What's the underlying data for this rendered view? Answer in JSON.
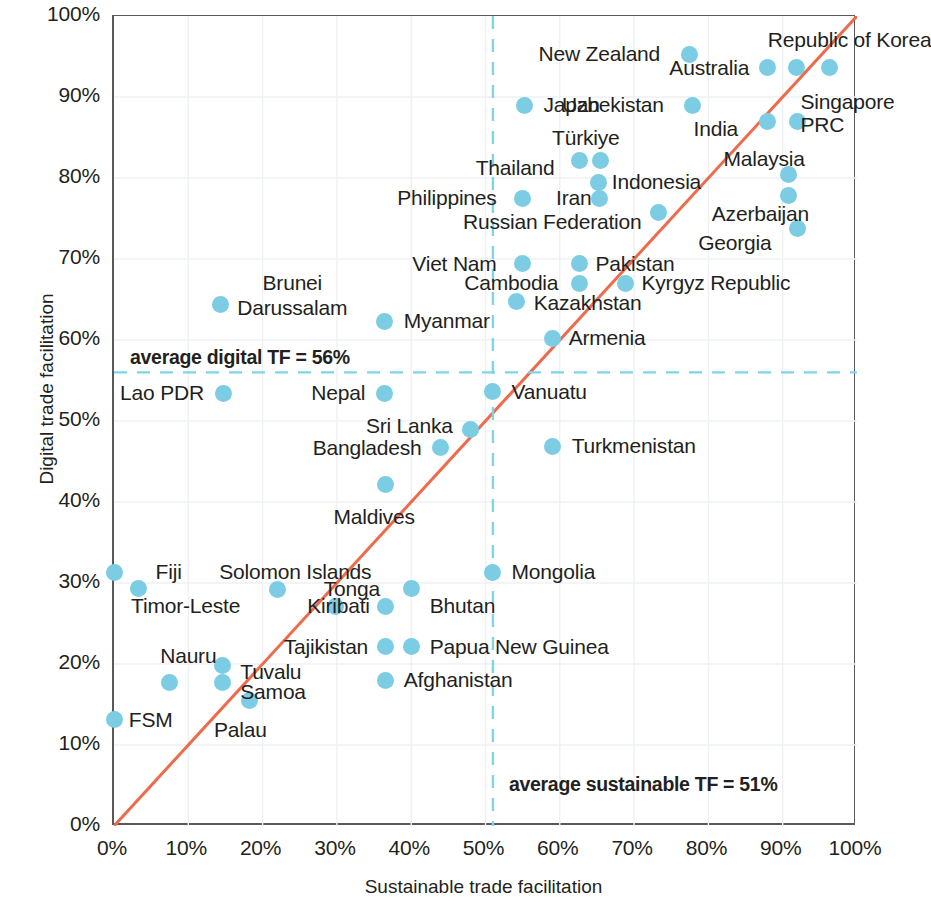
{
  "chart_data": {
    "type": "scatter",
    "title": "",
    "xlabel": "Sustainable trade facilitation",
    "ylabel": "Digital trade facilitation",
    "xlim": [
      0,
      100
    ],
    "ylim": [
      0,
      100
    ],
    "xticks": [
      "0%",
      "10%",
      "20%",
      "30%",
      "40%",
      "50%",
      "60%",
      "70%",
      "80%",
      "90%",
      "100%"
    ],
    "yticks": [
      "0%",
      "10%",
      "20%",
      "30%",
      "40%",
      "50%",
      "60%",
      "70%",
      "80%",
      "90%",
      "100%"
    ],
    "xtick_values": [
      0,
      10,
      20,
      30,
      40,
      50,
      60,
      70,
      80,
      90,
      100
    ],
    "ytick_values": [
      0,
      10,
      20,
      30,
      40,
      50,
      60,
      70,
      80,
      90,
      100
    ],
    "grid": true,
    "legend": "none",
    "marker_color": "#7ccde4",
    "reference_line_color": "#ef6a4a",
    "average_line_color": "#7fd4e8",
    "annotations": {
      "digital_avg_label": "average digital TF = 56%",
      "sustainable_avg_label": "average sustainable TF = 51%",
      "digital_avg_value": 56,
      "sustainable_avg_value": 51
    },
    "diagonal_line": {
      "from": [
        0,
        0
      ],
      "to": [
        100,
        100
      ]
    },
    "points": [
      {
        "name": "New Zealand",
        "x": 77.4,
        "y": 95.3,
        "lx": 73.5,
        "ly": 95.3,
        "anchor": "r"
      },
      {
        "name": "Republic of Korea",
        "x": 91.8,
        "y": 93.6,
        "lx": 88.0,
        "ly": 97.0,
        "anchor": "l"
      },
      {
        "name": "Australia",
        "x": 88.0,
        "y": 93.6,
        "lx": 85.5,
        "ly": 93.6,
        "anchor": "r"
      },
      {
        "name": "Singapore",
        "x": 96.3,
        "y": 93.6,
        "lx": 92.4,
        "ly": 89.4,
        "anchor": "l"
      },
      {
        "name": "Japan",
        "x": 55.3,
        "y": 89.0,
        "lx": 57.8,
        "ly": 89.0,
        "anchor": "l"
      },
      {
        "name": "Uzbekistan",
        "x": 77.8,
        "y": 89.0,
        "lx": 74.0,
        "ly": 89.0,
        "anchor": "r"
      },
      {
        "name": "India",
        "x": 88.0,
        "y": 87.0,
        "lx": 84.0,
        "ly": 86.0,
        "anchor": "r"
      },
      {
        "name": "PRC",
        "x": 92.0,
        "y": 87.0,
        "lx": 92.4,
        "ly": 86.5,
        "anchor": "l"
      },
      {
        "name": "Türkiye",
        "x": 65.5,
        "y": 82.2,
        "lx": 63.5,
        "ly": 85.0,
        "anchor": "c"
      },
      {
        "name": "Thailand",
        "x": 62.6,
        "y": 82.2,
        "lx": 59.3,
        "ly": 81.2,
        "anchor": "r"
      },
      {
        "name": "Malaysia",
        "x": 90.8,
        "y": 80.4,
        "lx": 87.5,
        "ly": 82.4,
        "anchor": "c"
      },
      {
        "name": "Indonesia",
        "x": 65.2,
        "y": 79.5,
        "lx": 67.0,
        "ly": 79.5,
        "anchor": "l"
      },
      {
        "name": "Philippines",
        "x": 55.0,
        "y": 77.5,
        "lx": 51.5,
        "ly": 77.5,
        "anchor": "r"
      },
      {
        "name": "Iran",
        "x": 65.4,
        "y": 77.5,
        "lx": 59.5,
        "ly": 77.5,
        "anchor": "l"
      },
      {
        "name": "Azerbaijan",
        "x": 90.8,
        "y": 77.8,
        "lx": 87.0,
        "ly": 75.6,
        "anchor": "c"
      },
      {
        "name": "Russian Federation",
        "x": 73.3,
        "y": 75.7,
        "lx": 71.0,
        "ly": 74.6,
        "anchor": "r"
      },
      {
        "name": "Georgia",
        "x": 92.0,
        "y": 73.8,
        "lx": 88.5,
        "ly": 72.0,
        "anchor": "r"
      },
      {
        "name": "Viet Nam",
        "x": 55.0,
        "y": 69.4,
        "lx": 51.5,
        "ly": 69.4,
        "anchor": "r"
      },
      {
        "name": "Pakistan",
        "x": 62.7,
        "y": 69.4,
        "lx": 64.8,
        "ly": 69.4,
        "anchor": "l"
      },
      {
        "name": "Cambodia",
        "x": 62.7,
        "y": 67.0,
        "lx": 59.8,
        "ly": 67.0,
        "anchor": "r"
      },
      {
        "name": "Kyrgyz Republic",
        "x": 68.8,
        "y": 67.0,
        "lx": 71.0,
        "ly": 67.0,
        "anchor": "l"
      },
      {
        "name": "Kazakhstan",
        "x": 54.2,
        "y": 64.8,
        "lx": 56.5,
        "ly": 64.6,
        "anchor": "l"
      },
      {
        "name": "Brunei Darussalam",
        "x": 14.4,
        "y": 64.4,
        "lx": 24.0,
        "ly": 65.5,
        "anchor": "c",
        "multiline": true
      },
      {
        "name": "Myanmar",
        "x": 36.4,
        "y": 62.3,
        "lx": 39.0,
        "ly": 62.3,
        "anchor": "l"
      },
      {
        "name": "Armenia",
        "x": 59.0,
        "y": 60.2,
        "lx": 61.2,
        "ly": 60.2,
        "anchor": "l"
      },
      {
        "name": "Lao PDR",
        "x": 14.7,
        "y": 53.4,
        "lx": 12.1,
        "ly": 53.4,
        "anchor": "r"
      },
      {
        "name": "Nepal",
        "x": 36.4,
        "y": 53.4,
        "lx": 33.8,
        "ly": 53.4,
        "anchor": "r"
      },
      {
        "name": "Vanuatu",
        "x": 51.0,
        "y": 53.6,
        "lx": 53.5,
        "ly": 53.6,
        "anchor": "l"
      },
      {
        "name": "Sri Lanka",
        "x": 48.0,
        "y": 49.0,
        "lx": 45.6,
        "ly": 49.4,
        "anchor": "r"
      },
      {
        "name": "Turkmenistan",
        "x": 59.0,
        "y": 46.9,
        "lx": 61.6,
        "ly": 46.9,
        "anchor": "l"
      },
      {
        "name": "Bangladesh",
        "x": 44.0,
        "y": 46.7,
        "lx": 41.4,
        "ly": 46.7,
        "anchor": "r"
      },
      {
        "name": "Maldives",
        "x": 36.5,
        "y": 42.2,
        "lx": 35.0,
        "ly": 38.2,
        "anchor": "c"
      },
      {
        "name": "Fiji",
        "x": 3.3,
        "y": 29.3,
        "lx": 5.6,
        "ly": 31.3,
        "anchor": "l"
      },
      {
        "name": "Timor-Leste",
        "x": 0.0,
        "y": 31.3,
        "lx": 2.3,
        "ly": 27.2,
        "anchor": "l"
      },
      {
        "name": "Solomon Islands",
        "x": 22.0,
        "y": 29.2,
        "lx": 24.4,
        "ly": 31.3,
        "anchor": "c"
      },
      {
        "name": "Tonga",
        "x": 29.8,
        "y": 27.1,
        "lx": 32.0,
        "ly": 29.2,
        "anchor": "c"
      },
      {
        "name": "Bhutan",
        "x": 40.0,
        "y": 29.3,
        "lx": 42.5,
        "ly": 27.2,
        "anchor": "l"
      },
      {
        "name": "Kiribati",
        "x": 36.5,
        "y": 27.1,
        "lx": 26.0,
        "ly": 27.2,
        "anchor": "l"
      },
      {
        "name": "Tajikistan",
        "x": 36.5,
        "y": 22.1,
        "lx": 34.2,
        "ly": 22.1,
        "anchor": "r"
      },
      {
        "name": "Papua New Guinea",
        "x": 40.0,
        "y": 22.1,
        "lx": 42.5,
        "ly": 22.1,
        "anchor": "l"
      },
      {
        "name": "Nauru",
        "x": 7.5,
        "y": 17.7,
        "lx": 10.0,
        "ly": 21.0,
        "anchor": "c"
      },
      {
        "name": "Tuvalu",
        "x": 14.6,
        "y": 19.8,
        "lx": 17.0,
        "ly": 19.0,
        "anchor": "l"
      },
      {
        "name": "Samoa",
        "x": 14.6,
        "y": 17.7,
        "lx": 17.0,
        "ly": 16.5,
        "anchor": "l"
      },
      {
        "name": "Afghanistan",
        "x": 36.5,
        "y": 18.0,
        "lx": 39.0,
        "ly": 18.0,
        "anchor": "l"
      },
      {
        "name": "Palau",
        "x": 18.2,
        "y": 15.5,
        "lx": 17.0,
        "ly": 11.8,
        "anchor": "c"
      },
      {
        "name": "FSM",
        "x": 0.0,
        "y": 13.1,
        "lx": 2.0,
        "ly": 13.1,
        "anchor": "l"
      },
      {
        "name": "Mongolia",
        "x": 51.0,
        "y": 31.3,
        "lx": 53.5,
        "ly": 31.3,
        "anchor": "l"
      }
    ]
  }
}
